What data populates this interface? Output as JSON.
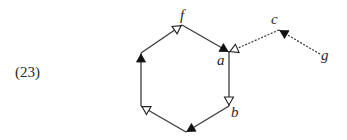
{
  "diagram": {
    "example_number": "(23)",
    "colors": {
      "line": "#3a3a3a",
      "arrow_filled": "#111111",
      "arrow_open_stroke": "#222222",
      "background": "#ffffff"
    },
    "nodes": [
      {
        "id": "f",
        "label": "f",
        "x": 182,
        "y": 25,
        "label_x": 180,
        "label_y": 20
      },
      {
        "id": "a",
        "label": "a",
        "x": 229,
        "y": 52,
        "label_x": 217,
        "label_y": 65
      },
      {
        "id": "b",
        "label": "b",
        "x": 229,
        "y": 106,
        "label_x": 231,
        "label_y": 117
      },
      {
        "id": "bottom",
        "label": "",
        "x": 186,
        "y": 132
      },
      {
        "id": "lower-left",
        "label": "",
        "x": 141,
        "y": 106
      },
      {
        "id": "upper-left",
        "label": "",
        "x": 141,
        "y": 53
      },
      {
        "id": "c",
        "label": "c",
        "x": 279,
        "y": 30,
        "label_x": 271,
        "label_y": 24
      },
      {
        "id": "g",
        "label": "g",
        "x": 320,
        "y": 54,
        "label_x": 321,
        "label_y": 60
      }
    ],
    "edges": [
      {
        "from": "upper-left",
        "to": "f",
        "style": "solid",
        "arrow": "open",
        "arrow_at": "f"
      },
      {
        "from": "f",
        "to": "a",
        "style": "solid",
        "arrow": "filled",
        "arrow_at": "a"
      },
      {
        "from": "a",
        "to": "b",
        "style": "solid",
        "arrow": "open",
        "arrow_at": "b"
      },
      {
        "from": "b",
        "to": "bottom",
        "style": "solid",
        "arrow": "filled",
        "arrow_at": "bottom"
      },
      {
        "from": "bottom",
        "to": "lower-left",
        "style": "solid",
        "arrow": "open",
        "arrow_at": "lower-left"
      },
      {
        "from": "lower-left",
        "to": "upper-left",
        "style": "solid",
        "arrow": "filled",
        "arrow_at": "upper-left"
      },
      {
        "from": "c",
        "to": "a",
        "style": "dashed",
        "arrow": "open",
        "arrow_at": "a"
      },
      {
        "from": "g",
        "to": "c",
        "style": "dashed",
        "arrow": "filled",
        "arrow_at": "c"
      }
    ]
  }
}
